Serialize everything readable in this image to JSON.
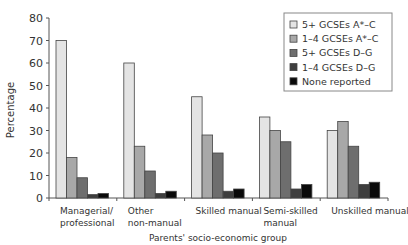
{
  "chart_data": {
    "type": "bar",
    "title": "",
    "xlabel": "Parents' socio-economic group",
    "ylabel": "Percentage",
    "ylim": [
      0,
      80
    ],
    "yticks": [
      0,
      10,
      20,
      30,
      40,
      50,
      60,
      70,
      80
    ],
    "grid": false,
    "legend_position": "top-right",
    "categories": [
      [
        "Managerial/",
        "professional"
      ],
      [
        "Other",
        "non-manual"
      ],
      [
        "Skilled manual"
      ],
      [
        "Semi-skilled",
        "manual"
      ],
      [
        "Unskilled manual"
      ]
    ],
    "category_names": [
      "Managerial/professional",
      "Other non-manual",
      "Skilled manual",
      "Semi-skilled manual",
      "Unskilled manual"
    ],
    "series": [
      {
        "name": "5+ GCSEs A*–C",
        "color": "#e4e4e4",
        "values": [
          70,
          60,
          45,
          36,
          30
        ]
      },
      {
        "name": "1–4 GCSEs A*–C",
        "color": "#a8a8a8",
        "values": [
          18,
          23,
          28,
          30,
          34
        ]
      },
      {
        "name": "5+ GCSEs D–G",
        "color": "#6e6e6e",
        "values": [
          9,
          12,
          20,
          25,
          23
        ]
      },
      {
        "name": "1–4 GCSEs D–G",
        "color": "#3e3e3e",
        "values": [
          1.5,
          2,
          3,
          4,
          6
        ]
      },
      {
        "name": "None reported",
        "color": "#0a0a0a",
        "values": [
          2,
          3,
          4,
          6,
          7
        ]
      }
    ]
  }
}
